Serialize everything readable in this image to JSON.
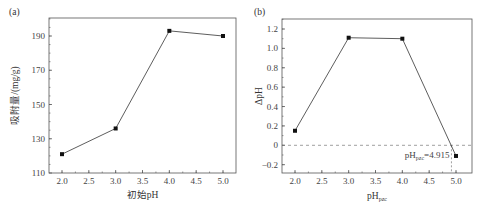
{
  "chart_data": [
    {
      "type": "line",
      "panel_label": "(a)",
      "title": "",
      "xlabel": "初始pH",
      "ylabel": "吸附量/(mg/g)",
      "x": [
        2.0,
        3.0,
        4.0,
        5.0
      ],
      "values": [
        121,
        136,
        193,
        190
      ],
      "xlim": [
        1.75,
        5.15
      ],
      "ylim": [
        110,
        200
      ],
      "xticks": [
        "2.0",
        "2.5",
        "3.0",
        "3.5",
        "4.0",
        "4.5",
        "5.0"
      ],
      "yticks": [
        "110",
        "130",
        "150",
        "170",
        "190"
      ],
      "marker": "square",
      "grid": false,
      "legend": null
    },
    {
      "type": "line",
      "panel_label": "(b)",
      "title": "",
      "xlabel": "pHpzc",
      "xlabel_main": "pH",
      "xlabel_sub": "pzc",
      "ylabel": "ΔpH",
      "x": [
        2.0,
        3.0,
        4.0,
        5.0
      ],
      "values": [
        0.15,
        1.11,
        1.1,
        -0.11
      ],
      "xlim": [
        1.7,
        5.25
      ],
      "ylim": [
        -0.3,
        1.3
      ],
      "xticks": [
        "2.0",
        "2.5",
        "3.0",
        "3.5",
        "4.0",
        "4.5",
        "5.0"
      ],
      "yticks": [
        "-0.2",
        "0",
        "0.2",
        "0.4",
        "0.6",
        "0.8",
        "1.0",
        "1.2"
      ],
      "marker": "square",
      "grid": false,
      "legend": null,
      "reference_line": {
        "y": 0,
        "style": "dashed"
      },
      "annotation": {
        "text_main": "pH",
        "text_sub": "pzc",
        "text_value": "=4.915",
        "x": 4.915,
        "style": "dashed vertical drop line"
      }
    }
  ]
}
